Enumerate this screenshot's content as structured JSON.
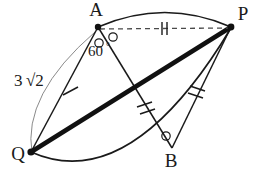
{
  "figure": {
    "kind": "geometry-diagram",
    "background_color": "#ffffff",
    "ink_color": "#1a1a1a"
  },
  "points": [
    {
      "id": "A",
      "label": "A",
      "x": 98,
      "y": 27,
      "label_x": 96,
      "label_y": 16,
      "dot": true
    },
    {
      "id": "P",
      "label": "P",
      "x": 231,
      "y": 27,
      "label_x": 243,
      "label_y": 20,
      "dot": true
    },
    {
      "id": "Q",
      "label": "Q",
      "x": 31,
      "y": 152,
      "label_x": 18,
      "label_y": 160,
      "dot": true
    },
    {
      "id": "B",
      "label": "B",
      "x": 172,
      "y": 148,
      "label_x": 171,
      "label_y": 167,
      "dot": false
    }
  ],
  "segments": [
    {
      "id": "QA",
      "from": "Q",
      "to": "A",
      "style": "thin",
      "ticks": 1,
      "color": "#1a1a1a"
    },
    {
      "id": "AB",
      "from": "A",
      "to": "B",
      "style": "thin",
      "ticks": 2,
      "color": "#1a1a1a"
    },
    {
      "id": "PB",
      "from": "P",
      "to": "B",
      "style": "thin",
      "ticks": 2,
      "color": "#1a1a1a"
    },
    {
      "id": "QP",
      "from": "Q",
      "to": "P",
      "style": "thick",
      "ticks": 0,
      "color": "#111111"
    },
    {
      "id": "AP",
      "from": "A",
      "to": "P",
      "style": "dashed",
      "ticks": 2,
      "color": "#4a4a4a"
    }
  ],
  "arcs": [
    {
      "id": "arc-top",
      "from": "A",
      "to": "P",
      "bulge": "up",
      "style": "thin-solid"
    },
    {
      "id": "arc-bottom",
      "from": "Q",
      "to": "P",
      "bulge": "down",
      "style": "thin-solid"
    },
    {
      "id": "arc-left",
      "from": "Q",
      "to": "A",
      "bulge": "left",
      "style": "hairline"
    }
  ],
  "angle_marks": [
    {
      "id": "angle-A-left",
      "at": "A",
      "marker": "small-circle",
      "x": 99,
      "y": 43
    },
    {
      "id": "angle-A-right",
      "at": "A",
      "marker": "small-circle",
      "x": 112,
      "y": 37
    },
    {
      "id": "angle-B",
      "at": "B",
      "marker": "small-circle",
      "x": 166,
      "y": 136
    }
  ],
  "labels": {
    "angle_value": "60",
    "angle_degree_symbol": "°",
    "side_length": "3",
    "side_radical": "√2",
    "side_length_full": "3√2"
  },
  "label_positions": {
    "angle_text_x": 88,
    "angle_text_y": 56,
    "side_text_x": 14,
    "side_text_y": 86
  },
  "tick_marks": {
    "QA_count": 1,
    "AB_count": 2,
    "PB_count": 2,
    "AP_count": 2
  },
  "colors": {
    "ink": "#1a1a1a",
    "thick_line": "#111111",
    "dashed_line": "#4a4a4a",
    "hairline": "#6b6b6b",
    "background": "#ffffff"
  }
}
